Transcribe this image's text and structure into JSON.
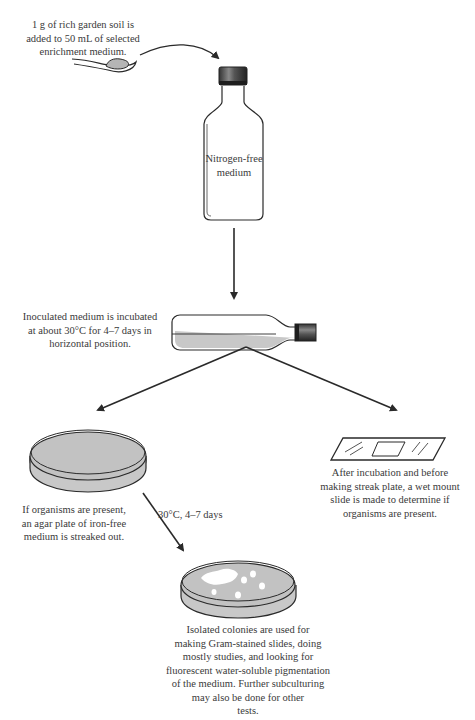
{
  "diagram": {
    "steps": {
      "soil_addition": {
        "lines": [
          "1 g of rich garden soil is",
          "added to 50 mL of selected",
          "enrichment medium."
        ]
      },
      "bottle": {
        "label_lines": [
          "Nitrogen-free",
          "medium"
        ]
      },
      "incubation": {
        "lines": [
          "Inoculated medium is incubated",
          "at about 30°C for 4–7 days in",
          "horizontal position."
        ]
      },
      "streak_plate": {
        "lines": [
          "If organisms are present,",
          "an agar plate of iron-free",
          "medium is streaked out."
        ]
      },
      "wet_mount": {
        "lines": [
          "After incubation and before",
          "making streak plate, a wet mount",
          "slide is made to determine if",
          "organisms are present."
        ]
      },
      "plate_incubation": {
        "label": "30°C, 4–7 days"
      },
      "isolated_colonies": {
        "lines": [
          "Isolated colonies are used for",
          "making Gram-stained slides, doing",
          "mostly studies, and looking for",
          "fluorescent water-soluble pigmentation",
          "of the medium. Further subculturing",
          "may also be done for other",
          "tests."
        ]
      }
    },
    "colors": {
      "stroke": "#2a2a2a",
      "fill_medium": "#c8c8c8",
      "colony": "#ffffff",
      "text": "#3a3a3a"
    }
  }
}
